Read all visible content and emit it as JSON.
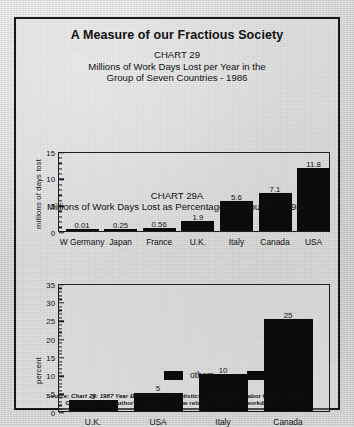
{
  "document": {
    "headline": "A Measure of our Fractious Society"
  },
  "chart29": {
    "number": "CHART 29",
    "subtitle_line1": "Millions of Work Days Lost per Year in the",
    "subtitle_line2": "Group of Seven Countries - 1986",
    "ylabel": "millions of days lost"
  },
  "chart29a": {
    "number": "CHART 29A",
    "subtitle_line1": "Millions of Work Days Lost as Percentage of Population 1986",
    "ylabel": "percent"
  },
  "legend": {
    "items": [
      {
        "label": "others",
        "color": "#0b0b0c"
      },
      {
        "label": "Canada",
        "color": "#0b0b0c"
      }
    ]
  },
  "source": {
    "line1_prefix": "Source: ",
    "line1_italic": "Chart 29: 1987 Year Book of Labor Statistics,",
    "line1_suffix": " International Labor Office, Geneva.",
    "line2": "Chart 29A is the author's attempt to show relative severity of workdays lost."
  },
  "chart_data": [
    {
      "type": "bar",
      "title": "CHART 29",
      "subtitle": "Millions of Work Days Lost per Year in the Group of Seven Countries - 1986",
      "xlabel": "",
      "ylabel": "millions of days lost",
      "ylim": [
        0,
        15
      ],
      "yticks": [
        0,
        5,
        10,
        15
      ],
      "yminor_step": 1,
      "grid": false,
      "legend": "none",
      "categories": [
        "W Germany",
        "Japan",
        "France",
        "U.K.",
        "Italy",
        "Canada",
        "USA"
      ],
      "values": [
        0.01,
        0.25,
        0.56,
        1.9,
        5.6,
        7.1,
        11.8
      ],
      "value_labels": [
        "0.01",
        "0.25",
        "0.56",
        "1.9",
        "5.6",
        "7.1",
        "11.8"
      ],
      "bar_color": "#0b0b0c"
    },
    {
      "type": "bar",
      "title": "CHART 29A",
      "subtitle": "Millions of Work Days Lost as Percentage of Population 1986",
      "xlabel": "",
      "ylabel": "percent",
      "ylim": [
        0,
        35
      ],
      "yticks": [
        0,
        5,
        10,
        15,
        20,
        25,
        30,
        35
      ],
      "yminor_step": 1,
      "grid": false,
      "legend_position": "below",
      "legend_entries": [
        "others",
        "Canada"
      ],
      "categories": [
        "U.K.",
        "USA",
        "Italy",
        "Canada"
      ],
      "values": [
        3,
        5,
        10,
        25
      ],
      "value_labels": [
        "3",
        "5",
        "10",
        "25"
      ],
      "bar_color": "#0b0b0c"
    }
  ]
}
